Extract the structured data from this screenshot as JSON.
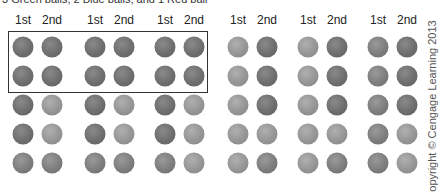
{
  "caption": "3 Green balls, 2 Blue balls, and 1 Red ball",
  "draw_labels": [
    "1st",
    "2nd"
  ],
  "groups": [
    {
      "x": [
        23,
        52
      ],
      "highlighted": true,
      "shades": [
        [
          "dark",
          "dark"
        ],
        [
          "dark",
          "dark"
        ],
        [
          "dark",
          "light"
        ],
        [
          "dark",
          "light"
        ],
        [
          "mid",
          "mid"
        ]
      ]
    },
    {
      "x": [
        95,
        124
      ],
      "highlighted": true,
      "shades": [
        [
          "dark",
          "dark"
        ],
        [
          "dark",
          "dark"
        ],
        [
          "dark",
          "light"
        ],
        [
          "dark",
          "light"
        ],
        [
          "mid",
          "mid"
        ]
      ]
    },
    {
      "x": [
        165,
        194
      ],
      "highlighted": true,
      "shades": [
        [
          "dark",
          "dark"
        ],
        [
          "dark",
          "dark"
        ],
        [
          "dark",
          "light"
        ],
        [
          "dark",
          "light"
        ],
        [
          "mid",
          "light"
        ]
      ]
    },
    {
      "x": [
        238,
        267
      ],
      "highlighted": false,
      "shades": [
        [
          "light",
          "dark"
        ],
        [
          "light",
          "dark"
        ],
        [
          "light",
          "dark"
        ],
        [
          "light",
          "light"
        ],
        [
          "light",
          "mid"
        ]
      ]
    },
    {
      "x": [
        308,
        337
      ],
      "highlighted": false,
      "shades": [
        [
          "light",
          "dark"
        ],
        [
          "light",
          "dark"
        ],
        [
          "light",
          "dark"
        ],
        [
          "light",
          "light"
        ],
        [
          "light",
          "mid"
        ]
      ]
    },
    {
      "x": [
        378,
        407
      ],
      "highlighted": false,
      "shades": [
        [
          "mid",
          "dark"
        ],
        [
          "mid",
          "dark"
        ],
        [
          "mid",
          "dark"
        ],
        [
          "mid",
          "light"
        ],
        [
          "mid",
          "light"
        ]
      ]
    }
  ],
  "row_y": [
    47,
    76,
    105,
    134,
    163
  ],
  "highlight_box": {
    "label": "first two rows of first three groups"
  },
  "copyright": "Copyright © Cengage Learning 2013"
}
